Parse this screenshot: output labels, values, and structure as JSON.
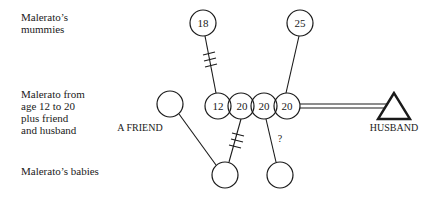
{
  "row_labels": {
    "mummies": "Malerato’s\nmummies",
    "malerato": "Malerato from\nage 12 to 20\nplus friend\nand husband",
    "babies": "Malerato’s babies"
  },
  "mummies": [
    {
      "label": "18"
    },
    {
      "label": "25"
    }
  ],
  "malerato_ages": [
    {
      "label": "12"
    },
    {
      "label": "20"
    },
    {
      "label": "20"
    },
    {
      "label": "20"
    }
  ],
  "friend": {
    "label": "A FRIEND"
  },
  "husband": {
    "label": "HUSBAND"
  },
  "uncertain_link": {
    "label": "?"
  },
  "colors": {
    "stroke": "#1a1a1a",
    "background": "#ffffff"
  }
}
